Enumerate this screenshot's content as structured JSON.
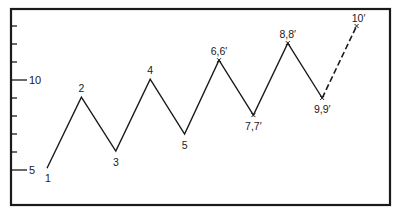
{
  "chart_data": {
    "type": "line",
    "title": "",
    "xlabel": "",
    "ylabel": "",
    "ylim": [
      3,
      14
    ],
    "grid": false,
    "legend": null,
    "y_ticks": [
      5,
      6,
      7,
      8,
      9,
      10,
      11,
      12,
      13
    ],
    "y_tick_labels": [
      {
        "value": 5,
        "label": "5"
      },
      {
        "value": 10,
        "label": "10"
      }
    ],
    "points": [
      {
        "label": "1",
        "x": 1,
        "y": 5.1,
        "marker": false
      },
      {
        "label": "2",
        "x": 2,
        "y": 9.05,
        "marker": false
      },
      {
        "label": "3",
        "x": 3,
        "y": 6.05,
        "marker": false
      },
      {
        "label": "4",
        "x": 4,
        "y": 10.05,
        "marker": false
      },
      {
        "label": "5",
        "x": 5,
        "y": 7.0,
        "marker": false
      },
      {
        "label": "6,6′",
        "x": 6,
        "y": 11.1,
        "marker": true
      },
      {
        "label": "7,7′",
        "x": 7,
        "y": 8.05,
        "marker": true
      },
      {
        "label": "8,8′",
        "x": 8,
        "y": 12.05,
        "marker": true
      },
      {
        "label": "9,9′",
        "x": 9,
        "y": 9.0,
        "marker": true
      },
      {
        "label": "10′",
        "x": 10,
        "y": 13.0,
        "marker": true
      }
    ],
    "series": [
      {
        "name": "actual",
        "style": "solid",
        "x": [
          1,
          2,
          3,
          4,
          5,
          6,
          7,
          8,
          9
        ],
        "values": [
          5.1,
          9.05,
          6.05,
          10.05,
          7.0,
          11.1,
          8.05,
          12.05,
          9.0
        ]
      },
      {
        "name": "projected",
        "style": "dashed",
        "x": [
          9,
          10
        ],
        "values": [
          9.0,
          13.0
        ]
      }
    ]
  }
}
